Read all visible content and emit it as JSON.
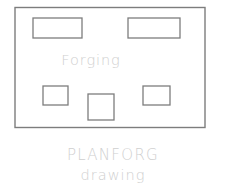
{
  "canvas": {
    "width": 243,
    "height": 189,
    "background_color": "#ffffff"
  },
  "diagram": {
    "name": "forging-plan-diagram",
    "stroke_color": "#7d7d7d",
    "text_color": "#cfcfcf",
    "outer_frame": {
      "name": "forging-area-outline",
      "x": 15,
      "y": 7.5,
      "width": 190,
      "height": 120
    },
    "inner_shapes": [
      {
        "name": "top-left-rectangle",
        "x": 33,
        "y": 18,
        "width": 49,
        "height": 20
      },
      {
        "name": "top-right-rectangle",
        "x": 128,
        "y": 18,
        "width": 52,
        "height": 20
      },
      {
        "name": "bottom-left-square",
        "x": 43,
        "y": 86,
        "width": 25,
        "height": 19
      },
      {
        "name": "bottom-center-square",
        "x": 88,
        "y": 94,
        "width": 26,
        "height": 26
      },
      {
        "name": "bottom-right-square",
        "x": 143,
        "y": 86,
        "width": 27,
        "height": 19
      }
    ],
    "inner_label": {
      "text": "Forging",
      "x": 91,
      "y": 65
    }
  },
  "caption": {
    "title": "PLANFORG",
    "subtitle": "drawing",
    "x": 113,
    "title_y": 160,
    "subtitle_y": 180
  }
}
